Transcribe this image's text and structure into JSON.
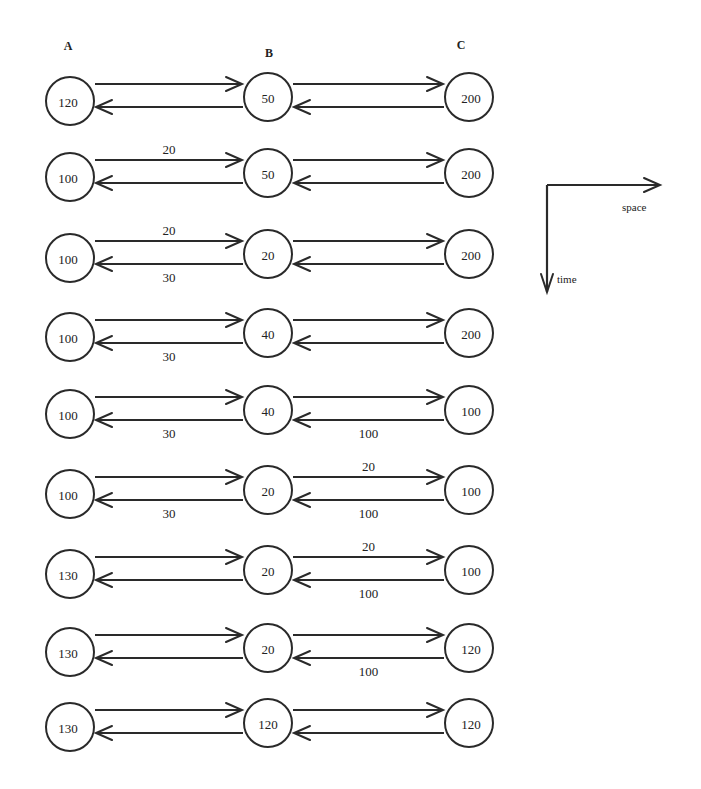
{
  "columns": [
    {
      "label": "A",
      "x": 70,
      "label_x": 68,
      "label_y": 50
    },
    {
      "label": "B",
      "x": 268,
      "label_x": 269,
      "label_y": 57
    },
    {
      "label": "C",
      "x": 469,
      "label_x": 461,
      "label_y": 49
    }
  ],
  "node_radius": 24,
  "rows": [
    {
      "y": 97,
      "nodes": [
        "120",
        "50",
        "200"
      ],
      "labels": {}
    },
    {
      "y": 173,
      "nodes": [
        "100",
        "50",
        "200"
      ],
      "labels": {
        "ab_top": "20"
      }
    },
    {
      "y": 254,
      "nodes": [
        "100",
        "20",
        "200"
      ],
      "labels": {
        "ab_top": "20",
        "ab_bottom": "30"
      }
    },
    {
      "y": 333,
      "nodes": [
        "100",
        "40",
        "200"
      ],
      "labels": {
        "ab_bottom": "30"
      }
    },
    {
      "y": 410,
      "nodes": [
        "100",
        "40",
        "100"
      ],
      "labels": {
        "ab_bottom": "30",
        "bc_bottom": "100"
      }
    },
    {
      "y": 490,
      "nodes": [
        "100",
        "20",
        "100"
      ],
      "labels": {
        "ab_bottom": "30",
        "bc_top": "20",
        "bc_bottom": "100"
      }
    },
    {
      "y": 570,
      "nodes": [
        "130",
        "20",
        "100"
      ],
      "labels": {
        "bc_top": "20",
        "bc_bottom": "100"
      }
    },
    {
      "y": 648,
      "nodes": [
        "130",
        "20",
        "120"
      ],
      "labels": {
        "bc_bottom": "100"
      }
    },
    {
      "y": 723,
      "nodes": [
        "130",
        "120",
        "120"
      ],
      "labels": {}
    }
  ],
  "axes": {
    "space_label": "space",
    "time_label": "time",
    "origin": [
      547,
      185
    ],
    "space_end": [
      660,
      185
    ],
    "time_end": [
      547,
      292
    ]
  },
  "colors": {
    "stroke": "#2a2a2a",
    "background": "#ffffff"
  }
}
